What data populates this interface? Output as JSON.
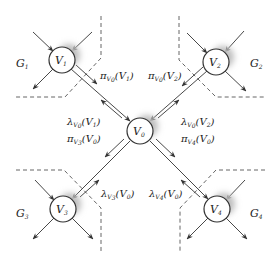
{
  "diagram": {
    "title": "",
    "nodes": [
      {
        "id": "V0",
        "label": "V",
        "sub": "0",
        "x": 140,
        "y": 131
      },
      {
        "id": "V1",
        "label": "V",
        "sub": "1",
        "x": 62,
        "y": 60
      },
      {
        "id": "V2",
        "label": "V",
        "sub": "2",
        "x": 216,
        "y": 62
      },
      {
        "id": "V3",
        "label": "V",
        "sub": "3",
        "x": 63,
        "y": 209
      },
      {
        "id": "V4",
        "label": "V",
        "sub": "4",
        "x": 217,
        "y": 209
      }
    ],
    "groups": [
      {
        "id": "G1",
        "label": "G",
        "sub": "1",
        "x": 16,
        "y": 67
      },
      {
        "id": "G2",
        "label": "G",
        "sub": "2",
        "x": 250,
        "y": 67
      },
      {
        "id": "G3",
        "label": "G",
        "sub": "3",
        "x": 16,
        "y": 217
      },
      {
        "id": "G4",
        "label": "G",
        "sub": "4",
        "x": 250,
        "y": 217
      }
    ],
    "messages": [
      {
        "id": "pi_V0_V1",
        "symbol": "π",
        "sub": "V",
        "subsub": "0",
        "arg": "(V",
        "argsub": "1",
        "close": ")"
      },
      {
        "id": "pi_V0_V2",
        "symbol": "π",
        "sub": "V",
        "subsub": "0",
        "arg": "(V",
        "argsub": "2",
        "close": ")"
      },
      {
        "id": "lambda_V0_V1",
        "symbol": "λ",
        "sub": "V",
        "subsub": "0",
        "arg": "(V",
        "argsub": "1",
        "close": ")"
      },
      {
        "id": "pi_V3_V0",
        "symbol": "π",
        "sub": "V",
        "subsub": "3",
        "arg": "(V",
        "argsub": "0",
        "close": ")"
      },
      {
        "id": "lambda_V0_V2",
        "symbol": "λ",
        "sub": "V",
        "subsub": "0",
        "arg": "(V",
        "argsub": "2",
        "close": ")"
      },
      {
        "id": "pi_V4_V0",
        "symbol": "π",
        "sub": "V",
        "subsub": "4",
        "arg": "(V",
        "argsub": "0",
        "close": ")"
      },
      {
        "id": "lambda_V3_V0",
        "symbol": "λ",
        "sub": "V",
        "subsub": "3",
        "arg": "(V",
        "argsub": "0",
        "close": ")"
      },
      {
        "id": "lambda_V4_V0",
        "symbol": "λ",
        "sub": "V",
        "subsub": "4",
        "arg": "(V",
        "argsub": "0",
        "close": ")"
      }
    ],
    "colors": {
      "line": "#333333",
      "dashed": "#555555",
      "node_fill": "#ffffff",
      "shadow": "#bdbdbd"
    }
  }
}
